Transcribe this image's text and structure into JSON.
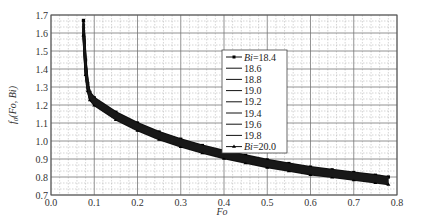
{
  "chart_data": {
    "type": "line",
    "title": "",
    "xlabel": "Fo",
    "ylabel": "f0(Fo, Bi)",
    "xlim": [
      0.0,
      0.8
    ],
    "ylim": [
      0.7,
      1.7
    ],
    "xticks": [
      "0.0",
      "0.1",
      "0.2",
      "0.3",
      "0.4",
      "0.5",
      "0.6",
      "0.7",
      "0.8"
    ],
    "yticks": [
      "0.7",
      "0.8",
      "0.9",
      "1.0",
      "1.1",
      "1.2",
      "1.3",
      "1.4",
      "1.5",
      "1.6",
      "1.7"
    ],
    "grid": true,
    "legend_position": "upper center",
    "x": [
      0.075,
      0.08,
      0.085,
      0.09,
      0.1,
      0.15,
      0.2,
      0.25,
      0.3,
      0.35,
      0.4,
      0.45,
      0.5,
      0.55,
      0.6,
      0.65,
      0.7,
      0.75,
      0.78
    ],
    "series": [
      {
        "name": "Bi=18.4",
        "marker": "square",
        "values": [
          1.67,
          1.45,
          1.32,
          1.27,
          1.24,
          1.16,
          1.1,
          1.05,
          1.01,
          0.975,
          0.945,
          0.92,
          0.895,
          0.875,
          0.855,
          0.84,
          0.825,
          0.81,
          0.8
        ]
      },
      {
        "name": "18.6",
        "marker": "none",
        "values": [
          1.66,
          1.44,
          1.315,
          1.265,
          1.235,
          1.155,
          1.095,
          1.045,
          1.005,
          0.97,
          0.94,
          0.915,
          0.89,
          0.87,
          0.85,
          0.835,
          0.82,
          0.805,
          0.795
        ]
      },
      {
        "name": "18.8",
        "marker": "none",
        "values": [
          1.65,
          1.43,
          1.31,
          1.26,
          1.23,
          1.15,
          1.09,
          1.04,
          1.0,
          0.965,
          0.935,
          0.91,
          0.885,
          0.865,
          0.845,
          0.83,
          0.815,
          0.8,
          0.79
        ]
      },
      {
        "name": "19.0",
        "marker": "none",
        "values": [
          1.64,
          1.42,
          1.305,
          1.255,
          1.225,
          1.145,
          1.085,
          1.035,
          0.995,
          0.96,
          0.93,
          0.905,
          0.88,
          0.86,
          0.84,
          0.825,
          0.81,
          0.795,
          0.785
        ]
      },
      {
        "name": "19.2",
        "marker": "none",
        "values": [
          1.63,
          1.41,
          1.3,
          1.25,
          1.22,
          1.14,
          1.08,
          1.03,
          0.99,
          0.955,
          0.925,
          0.9,
          0.875,
          0.855,
          0.835,
          0.82,
          0.805,
          0.79,
          0.78
        ]
      },
      {
        "name": "19.4",
        "marker": "none",
        "values": [
          1.62,
          1.4,
          1.295,
          1.245,
          1.215,
          1.135,
          1.075,
          1.025,
          0.985,
          0.95,
          0.92,
          0.895,
          0.87,
          0.85,
          0.83,
          0.815,
          0.8,
          0.785,
          0.775
        ]
      },
      {
        "name": "19.6",
        "marker": "none",
        "values": [
          1.61,
          1.39,
          1.29,
          1.24,
          1.21,
          1.13,
          1.07,
          1.02,
          0.98,
          0.945,
          0.915,
          0.89,
          0.865,
          0.845,
          0.825,
          0.81,
          0.795,
          0.78,
          0.77
        ]
      },
      {
        "name": "19.8",
        "marker": "none",
        "values": [
          1.6,
          1.38,
          1.285,
          1.235,
          1.205,
          1.125,
          1.065,
          1.015,
          0.975,
          0.94,
          0.91,
          0.885,
          0.86,
          0.84,
          0.82,
          0.805,
          0.79,
          0.775,
          0.765
        ]
      },
      {
        "name": "Bi=20.0",
        "marker": "triangle",
        "values": [
          1.59,
          1.37,
          1.28,
          1.23,
          1.2,
          1.12,
          1.06,
          1.01,
          0.97,
          0.935,
          0.905,
          0.88,
          0.855,
          0.835,
          0.815,
          0.8,
          0.785,
          0.77,
          0.76
        ]
      }
    ]
  },
  "legend": {
    "items": [
      {
        "label": "Bi=18.4",
        "prefix": "Bi",
        "value": "=18.4"
      },
      {
        "label": "18.6"
      },
      {
        "label": "18.8"
      },
      {
        "label": "19.0"
      },
      {
        "label": "19.2"
      },
      {
        "label": "19.4"
      },
      {
        "label": "19.6"
      },
      {
        "label": "19.8"
      },
      {
        "label": "Bi=20.0",
        "prefix": "Bi",
        "value": "=20.0"
      }
    ]
  },
  "axes": {
    "xlabel": "Fo",
    "ylabel_main": "f",
    "ylabel_sub": "0",
    "ylabel_args": "(Fo, Bi)"
  }
}
